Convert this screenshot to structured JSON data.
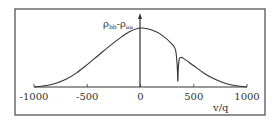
{
  "chart_data": {
    "type": "line",
    "title": "",
    "xlabel": "v/q",
    "ylabel": "ρbb-ρaa",
    "ylabel_parts": {
      "main1": "ρ",
      "sub1": "bb",
      "dash": "-",
      "main2": "ρ",
      "sub2": "aa"
    },
    "xlim": [
      -1000,
      1000
    ],
    "ylim": [
      0,
      1
    ],
    "grid": false,
    "legend": "none",
    "x_ticks": [
      -1000,
      -500,
      0,
      500,
      1000
    ],
    "x_tick_labels": [
      "-1000",
      "-500",
      "0",
      "500",
      "1000"
    ],
    "series": [
      {
        "name": "population difference",
        "description": "Gaussian-like profile peaked at v=0 with a narrow hole-burning dip near v=350",
        "x": [
          -1000,
          -900,
          -800,
          -700,
          -600,
          -500,
          -400,
          -300,
          -200,
          -100,
          0,
          100,
          200,
          300,
          330,
          345,
          350,
          355,
          365,
          380,
          400,
          500,
          600,
          700,
          800,
          900,
          1000
        ],
        "y": [
          0.0,
          0.02,
          0.06,
          0.13,
          0.24,
          0.38,
          0.53,
          0.68,
          0.82,
          0.94,
          1.0,
          0.97,
          0.88,
          0.72,
          0.62,
          0.35,
          0.1,
          0.32,
          0.48,
          0.5,
          0.49,
          0.36,
          0.23,
          0.13,
          0.06,
          0.02,
          0.0
        ]
      }
    ],
    "colors": {
      "line": "#333333",
      "frame": "#555555",
      "background": "#ffffff"
    }
  }
}
